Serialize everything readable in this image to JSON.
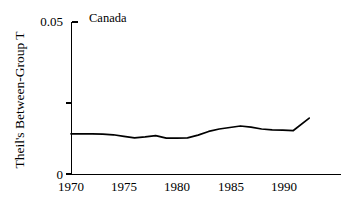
{
  "chart_data": {
    "type": "line",
    "title": "Canada",
    "xlabel": "",
    "ylabel": "Theil's Between-Group T",
    "xlim": [
      1970,
      1995.5
    ],
    "ylim": [
      0,
      0.05
    ],
    "grid": false,
    "legend": null,
    "y_tick_labels": [
      "0.05",
      "0"
    ],
    "y_tick_values": [
      0.05,
      0
    ],
    "y_unlabeled_tick_values": [
      0.025
    ],
    "x_tick_labels": [
      "1970",
      "1975",
      "1980",
      "1985",
      "1990"
    ],
    "x_tick_values": [
      1970,
      1975,
      1980,
      1985,
      1990
    ],
    "series": [
      {
        "name": "Theil's Between-Group T",
        "x": [
          1970,
          1971,
          1972,
          1973,
          1974,
          1975,
          1976,
          1977,
          1978,
          1979,
          1980,
          1981,
          1982,
          1983,
          1984,
          1985,
          1986,
          1987,
          1988,
          1989,
          1990,
          1991,
          1992.5
        ],
        "values": [
          0.0132,
          0.0132,
          0.0132,
          0.0131,
          0.0129,
          0.0124,
          0.0119,
          0.0122,
          0.0126,
          0.0118,
          0.0118,
          0.0119,
          0.0128,
          0.014,
          0.0148,
          0.0153,
          0.0158,
          0.0154,
          0.0148,
          0.0145,
          0.0144,
          0.0143,
          0.0184
        ]
      }
    ]
  },
  "axes": {
    "panel_title": "Canada",
    "y_axis_title": "Theil's Between-Group T",
    "y_top_label": "0.05",
    "y_bottom_label": "0",
    "x_labels": [
      "1970",
      "1975",
      "1980",
      "1985",
      "1990"
    ]
  },
  "colors": {
    "line": "#000000",
    "axis": "#000000",
    "background": "#ffffff"
  }
}
